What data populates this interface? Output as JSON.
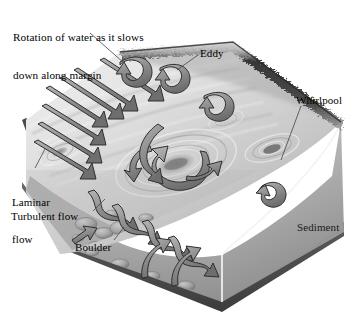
{
  "figure": {
    "medium": "grayscale scientific illustration",
    "palette": {
      "background": "#ffffff",
      "water_light": "#e9e9e9",
      "water_mid": "#c6c6c6",
      "water_dark": "#9a9a9a",
      "arrow_fill": "#8e8e8e",
      "arrow_stroke": "#2f2f2f",
      "sediment_face": "#b0b0b0",
      "bank_dark": "#3a3a3a",
      "base_dark": "#4a4a4a",
      "leader_line": "#555555",
      "text": "#000000",
      "cut_line": "#ffffff"
    }
  },
  "labels": {
    "title": "Rotation of water as it slows\ndown along margin",
    "title_line1": "Rotation of water as it slows",
    "title_line2": "down along margin",
    "eddy": "Eddy",
    "whirlpool": "Whirlpool",
    "laminar": "Laminar\nflow",
    "laminar_line1": "Laminar",
    "laminar_line2": "flow",
    "turbulent": "Turbulent flow",
    "boulder": "Boulder",
    "sediment": "Sediment"
  },
  "leaders": [
    {
      "name": "title-leader",
      "from": [
        90,
        33
      ],
      "to": [
        122,
        62
      ]
    },
    {
      "name": "eddy-leader",
      "from": [
        198,
        55
      ],
      "to": [
        178,
        70
      ]
    },
    {
      "name": "whirlpool-leader",
      "from": [
        300,
        105
      ],
      "to": [
        281,
        160
      ]
    },
    {
      "name": "laminar-leader",
      "from": [
        34,
        168
      ],
      "to": [
        44,
        150
      ]
    },
    {
      "name": "turbulent-leader",
      "from": [
        92,
        212
      ],
      "to": [
        104,
        200
      ]
    },
    {
      "name": "boulder-leader",
      "from": [
        113,
        241
      ],
      "to": [
        123,
        228
      ]
    }
  ],
  "features": [
    {
      "name": "laminar-flow-arrows",
      "description": "parallel straight arrows along left margin",
      "count": 7
    },
    {
      "name": "eddy-arrows",
      "description": "curved hook arrows near far bank",
      "count": 4
    },
    {
      "name": "central-whirlpool",
      "description": "large rotating vortex with concentric ripples"
    },
    {
      "name": "small-whirlpool",
      "description": "small funnel depression near right bank"
    },
    {
      "name": "turbulent-arrows",
      "description": "wavy arrows over cobble bed",
      "count": 6
    },
    {
      "name": "boulder-bed",
      "description": "cobbles and boulders on channel floor"
    },
    {
      "name": "sediment-face",
      "description": "cut-away sediment panel on right side"
    },
    {
      "name": "far-bank",
      "description": "dark textured upper-right bank edge"
    }
  ]
}
